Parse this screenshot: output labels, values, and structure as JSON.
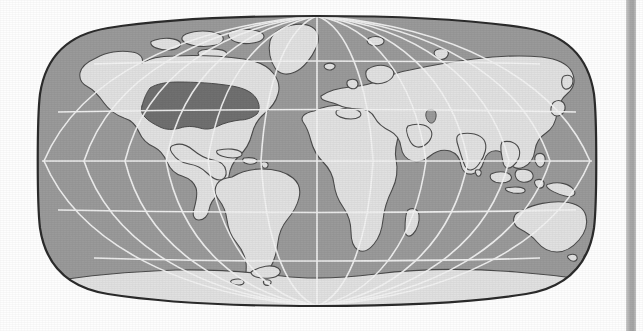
{
  "figure": {
    "kind": "world-map",
    "projection": "Robinson",
    "title": "",
    "caption": "",
    "highlight_label": "United States"
  },
  "colors": {
    "page_background": "#fefefe",
    "ocean": "#9a9a9a",
    "land": "#e2e2e2",
    "highlight_country": "#6f6f6f",
    "coastline": "#4a4a4a",
    "graticule": "#f4f4f4",
    "map_border": "#2b2b2b",
    "page_edge_strip": "#a8a8a8"
  },
  "map_frame": {
    "x": 36,
    "y": 14,
    "width": 562,
    "height": 294
  },
  "page_edge_strip": {
    "x": 626,
    "width": 10
  },
  "chart_data": {
    "type": "map",
    "projection": "Robinson",
    "title": "",
    "xlabel": "",
    "ylabel": "",
    "grid": true,
    "legend": "none",
    "lon_range": [
      -180,
      180
    ],
    "lat_range": [
      -90,
      90
    ],
    "graticule": {
      "parallels": [
        60,
        30,
        0,
        -30,
        -60
      ],
      "parallel_labels": [
        "60N",
        "30N",
        "0 (Equator)",
        "30S",
        "60S"
      ],
      "meridians": [
        -180,
        -150,
        -120,
        -90,
        -60,
        -30,
        0,
        30,
        60,
        90,
        120,
        150,
        180
      ],
      "meridian_labels": [
        "180W",
        "150W",
        "120W",
        "90W",
        "60W",
        "30W",
        "0 (Prime Meridian)",
        "30E",
        "60E",
        "90E",
        "120E",
        "150E",
        "180E"
      ],
      "meridian_spacing_deg": 30,
      "parallel_spacing_deg": 30
    },
    "highlighted_regions": [
      {
        "name": "United States",
        "color": "#6f6f6f",
        "value": 1
      }
    ],
    "landmasses": [
      "North America",
      "South America",
      "Africa",
      "Europe",
      "Asia",
      "Australia",
      "Antarctica",
      "Greenland",
      "Madagascar",
      "New Guinea",
      "New Zealand",
      "Japan",
      "British Isles",
      "Indonesia",
      "Philippines",
      "Iceland",
      "Sri Lanka",
      "Cuba",
      "Borneo",
      "Svalbard",
      "Tasmania"
    ]
  }
}
